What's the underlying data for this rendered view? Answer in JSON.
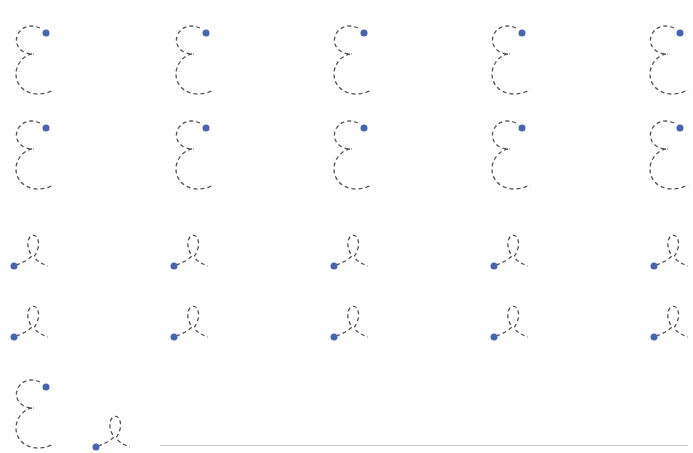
{
  "worksheet": {
    "type": "handwriting-tracing",
    "stroke_color": "#555555",
    "dot_color": "#4a64ad",
    "baseline_color": "#c8c8c8",
    "glyph_types": {
      "epsilon": "dashed-epsilon-tracing-glyph",
      "loop": "dashed-loop-tracing-glyph"
    },
    "rows": [
      {
        "glyph": "epsilon",
        "y": 22,
        "x": [
          12,
          172,
          330,
          488,
          646
        ]
      },
      {
        "glyph": "epsilon",
        "y": 117,
        "x": [
          12,
          172,
          330,
          488,
          646
        ]
      },
      {
        "glyph": "loop",
        "y": 232,
        "x": [
          8,
          168,
          328,
          488,
          648
        ]
      },
      {
        "glyph": "loop",
        "y": 303,
        "x": [
          8,
          168,
          328,
          488,
          648
        ]
      }
    ],
    "practice_row": {
      "epsilon": {
        "x": 12,
        "y": 376
      },
      "loop": {
        "x": 90,
        "y": 413
      },
      "baseline": {
        "x": 160,
        "y": 445,
        "width": 528
      }
    }
  }
}
